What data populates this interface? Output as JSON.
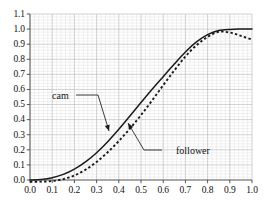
{
  "chart_data": {
    "type": "line",
    "title": "",
    "xlabel": "",
    "ylabel": "",
    "xlim": [
      0.0,
      1.0
    ],
    "ylim": [
      0.0,
      1.1
    ],
    "grid": true,
    "legend": "none",
    "xticks": [
      "0.0",
      "0.1",
      "0.2",
      "0.3",
      "0.4",
      "0.5",
      "0.6",
      "0.7",
      "0.8",
      "0.9",
      "1.0"
    ],
    "yticks": [
      "0.0",
      "0.1",
      "0.2",
      "0.3",
      "0.4",
      "0.5",
      "0.6",
      "0.7",
      "0.8",
      "0.9",
      "1.0",
      "1.1"
    ],
    "x": [
      0.0,
      0.05,
      0.1,
      0.15,
      0.2,
      0.25,
      0.3,
      0.35,
      0.4,
      0.45,
      0.5,
      0.55,
      0.6,
      0.65,
      0.7,
      0.75,
      0.8,
      0.85,
      0.9,
      0.95,
      1.0
    ],
    "series": [
      {
        "name": "cam",
        "style": "solid",
        "color": "#1a1a1a",
        "values": [
          0.0,
          0.004,
          0.015,
          0.037,
          0.072,
          0.12,
          0.181,
          0.254,
          0.336,
          0.424,
          0.513,
          0.601,
          0.685,
          0.768,
          0.848,
          0.915,
          0.963,
          0.99,
          0.998,
          1.0,
          1.0
        ]
      },
      {
        "name": "follower",
        "style": "dashed",
        "color": "#1a1a1a",
        "values": [
          -0.012,
          -0.011,
          -0.007,
          0.006,
          0.03,
          0.068,
          0.12,
          0.184,
          0.258,
          0.34,
          0.43,
          0.527,
          0.628,
          0.726,
          0.818,
          0.893,
          0.948,
          0.982,
          0.977,
          0.955,
          0.93
        ]
      }
    ],
    "annotations": [
      {
        "name": "cam",
        "text": "cam",
        "label_x": 52,
        "label_y": 90,
        "tip_x": 109,
        "tip_y": 131
      },
      {
        "name": "follower",
        "text": "follower",
        "label_x": 176,
        "label_y": 145,
        "tip_x": 128,
        "tip_y": 123
      }
    ]
  },
  "axis": {
    "y_labels": [
      "1.1",
      "1.0",
      "0.9",
      "0.8",
      "0.7",
      "0.6",
      "0.5",
      "0.4",
      "0.3",
      "0.2",
      "0.1",
      "0.0"
    ],
    "x_labels": [
      "0.0",
      "0.1",
      "0.2",
      "0.3",
      "0.4",
      "0.5",
      "0.6",
      "0.7",
      "0.8",
      "0.9",
      "1.0"
    ]
  },
  "annotations": {
    "cam_label": "cam",
    "follower_label": "follower"
  },
  "colors": {
    "line": "#1a1a1a",
    "grid_major": "#b9b9b9",
    "grid_minor": "#dcdcdc",
    "axis": "#555555",
    "text": "#111111",
    "background": "#ffffff"
  }
}
